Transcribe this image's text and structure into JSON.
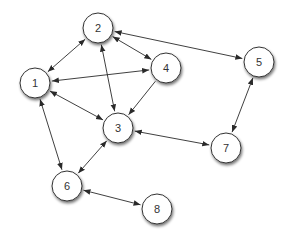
{
  "diagram": {
    "type": "directed-graph",
    "node_radius": 15,
    "colors": {
      "node_fill": "#ffffff",
      "node_stroke": "#333333",
      "edge": "#2a2a2a",
      "label": "#333333",
      "background": "#ffffff"
    },
    "nodes": [
      {
        "id": "1",
        "label": "1",
        "x": 35,
        "y": 83
      },
      {
        "id": "2",
        "label": "2",
        "x": 98,
        "y": 28
      },
      {
        "id": "3",
        "label": "3",
        "x": 118,
        "y": 128
      },
      {
        "id": "4",
        "label": "4",
        "x": 166,
        "y": 68
      },
      {
        "id": "5",
        "label": "5",
        "x": 259,
        "y": 62
      },
      {
        "id": "6",
        "label": "6",
        "x": 67,
        "y": 186
      },
      {
        "id": "7",
        "label": "7",
        "x": 226,
        "y": 148
      },
      {
        "id": "8",
        "label": "8",
        "x": 157,
        "y": 209
      }
    ],
    "edges": [
      {
        "from": "1",
        "to": "2",
        "bidirectional": true
      },
      {
        "from": "1",
        "to": "4",
        "bidirectional": true
      },
      {
        "from": "1",
        "to": "3",
        "bidirectional": true
      },
      {
        "from": "1",
        "to": "6",
        "bidirectional": true
      },
      {
        "from": "2",
        "to": "3",
        "bidirectional": true
      },
      {
        "from": "2",
        "to": "4",
        "bidirectional": true
      },
      {
        "from": "2",
        "to": "5",
        "bidirectional": true
      },
      {
        "from": "4",
        "to": "3",
        "bidirectional": false
      },
      {
        "from": "3",
        "to": "7",
        "bidirectional": true
      },
      {
        "from": "5",
        "to": "7",
        "bidirectional": true
      },
      {
        "from": "3",
        "to": "6",
        "bidirectional": true
      },
      {
        "from": "6",
        "to": "8",
        "bidirectional": true
      }
    ]
  }
}
